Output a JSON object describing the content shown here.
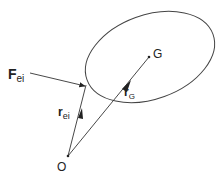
{
  "diagram": {
    "labels": {
      "force_main": "F",
      "force_sub": "ei",
      "r_ei_main": "r",
      "r_ei_sub": "ei",
      "r_G_main": "r",
      "r_G_sub": "G",
      "point_G": "G",
      "point_O": "O"
    },
    "colors": {
      "stroke": "#333333",
      "background": "#ffffff"
    }
  }
}
